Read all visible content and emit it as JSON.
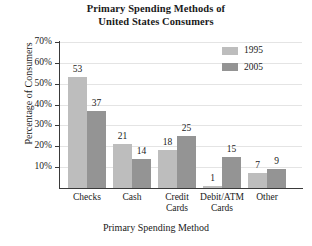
{
  "chart_data": {
    "type": "bar",
    "title": "Primary Spending Methods of United States Consumers",
    "title_lines": [
      "Primary Spending Methods of",
      "United States Consumers"
    ],
    "xlabel": "Primary Spending Method",
    "ylabel": "Percentage of Consumers",
    "categories": [
      "Checks",
      "Cash",
      "Credit Cards",
      "Debit/ATM Cards",
      "Other"
    ],
    "category_lines": [
      [
        "Checks"
      ],
      [
        "Cash"
      ],
      [
        "Credit",
        "Cards"
      ],
      [
        "Debit/ATM",
        "Cards"
      ],
      [
        "Other"
      ]
    ],
    "series": [
      {
        "name": "1995",
        "color": "#bdbdbd",
        "values": [
          53,
          21,
          18,
          1,
          7
        ]
      },
      {
        "name": "2005",
        "color": "#949494",
        "values": [
          37,
          14,
          25,
          15,
          9
        ]
      }
    ],
    "ylim": [
      0,
      70
    ],
    "yticks": [
      10,
      20,
      30,
      40,
      50,
      60,
      70
    ],
    "ytick_labels": [
      "10%",
      "20%",
      "30%",
      "40%",
      "50%",
      "60%",
      "70%"
    ],
    "grid": true,
    "grid_color": "#e4e4e4",
    "legend_position": "top-right",
    "value_labels": true
  }
}
